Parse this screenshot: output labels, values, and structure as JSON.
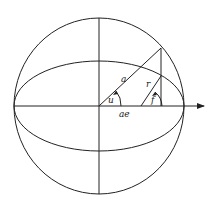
{
  "diagram": {
    "type": "orbital-geometry",
    "labels": {
      "a": "a",
      "r": "r",
      "u": "u",
      "f": "f",
      "ae": "ae"
    },
    "colors": {
      "stroke": "#222222",
      "background": "#ffffff"
    }
  }
}
